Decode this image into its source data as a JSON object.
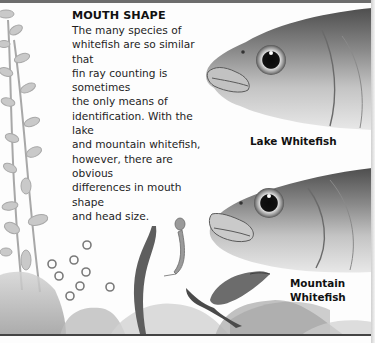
{
  "section": {
    "heading": "MOUTH SHAPE",
    "body": "The many species of whitefish are so similar that fin ray counting is sometimes the only means of identification. With the lake and mountain whitefish, however, there are obvious differences in mouth shape and head size.",
    "body_lines": [
      "The many species of",
      "whitefish are so similar that",
      "fin ray counting is sometimes",
      "the only means of",
      "identification. With the lake",
      "and mountain whitefish,",
      "however, there are obvious",
      "differences in mouth shape",
      "and head size."
    ]
  },
  "illustrations": {
    "upper_fish": {
      "caption": "Lake Whitefish"
    },
    "lower_fish": {
      "caption_line1": "Mountain",
      "caption_line2": "Whitefish"
    }
  },
  "colors": {
    "ink": "#1c1c1c",
    "rule": "#6d6d6d",
    "fish_dark": "#5a5a5a",
    "fish_mid": "#9a9a9a",
    "fish_light": "#d8d8d8"
  }
}
